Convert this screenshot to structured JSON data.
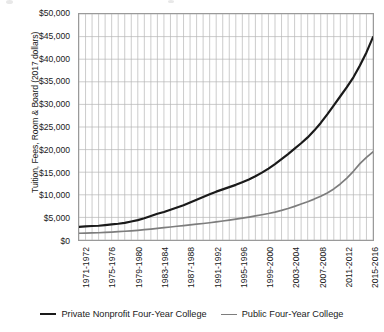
{
  "chart_data": {
    "type": "line",
    "title": "",
    "xlabel": "",
    "ylabel": "Tuition, Fees, Room & Board (2017 dollars)",
    "ylim": [
      0,
      50000
    ],
    "ytick_labels": [
      "$50,000",
      "$45,000",
      "$40,000",
      "$35,000",
      "$30,000",
      "$25,000",
      "$20,000",
      "$15,000",
      "$10,000",
      "$5,000",
      "$0"
    ],
    "ytick_values": [
      50000,
      45000,
      40000,
      35000,
      30000,
      25000,
      20000,
      15000,
      10000,
      5000,
      0
    ],
    "grid": true,
    "legend_position": "bottom",
    "x_axis_note": "Academic years 1971-1972 through 2016-2017; minor gridline every year, label every 4 years",
    "categories": [
      "1971-1972",
      "1972-1973",
      "1973-1974",
      "1974-1975",
      "1975-1976",
      "1976-1977",
      "1977-1978",
      "1978-1979",
      "1979-1980",
      "1980-1981",
      "1981-1982",
      "1982-1983",
      "1983-1984",
      "1984-1985",
      "1985-1986",
      "1986-1987",
      "1987-1988",
      "1988-1989",
      "1989-1990",
      "1990-1991",
      "1991-1992",
      "1992-1993",
      "1993-1994",
      "1994-1995",
      "1995-1996",
      "1996-1997",
      "1997-1998",
      "1998-1999",
      "1999-2000",
      "2000-2001",
      "2001-2002",
      "2002-2003",
      "2003-2004",
      "2004-2005",
      "2005-2006",
      "2006-2007",
      "2007-2008",
      "2008-2009",
      "2009-2010",
      "2010-2011",
      "2011-2012",
      "2012-2013",
      "2013-2014",
      "2014-2015",
      "2015-2016",
      "2016-2017"
    ],
    "xtick_labels": [
      "1971-1972",
      "1975-1976",
      "1979-1980",
      "1983-1984",
      "1987-1988",
      "1991-1992",
      "1995-1996",
      "1999-2000",
      "2003-2004",
      "2007-2008",
      "2011-2012",
      "2015-2016"
    ],
    "xtick_indices": [
      0,
      4,
      8,
      12,
      16,
      20,
      24,
      28,
      32,
      36,
      40,
      44
    ],
    "series": [
      {
        "name": "Private Nonprofit Four-Year College",
        "color": "#1a1a1a",
        "values": [
          2900,
          3000,
          3100,
          3150,
          3300,
          3450,
          3600,
          3800,
          4100,
          4400,
          4800,
          5300,
          5800,
          6200,
          6700,
          7200,
          7700,
          8300,
          8900,
          9500,
          10100,
          10700,
          11200,
          11700,
          12200,
          12800,
          13400,
          14100,
          14900,
          15800,
          16800,
          17900,
          19000,
          20200,
          21400,
          22700,
          24200,
          25900,
          27800,
          29800,
          31800,
          33800,
          36000,
          38600,
          41500,
          44900
        ]
      },
      {
        "name": "Public Four-Year College",
        "color": "#7d7d7d",
        "values": [
          1500,
          1530,
          1560,
          1600,
          1680,
          1760,
          1840,
          1930,
          2030,
          2150,
          2280,
          2420,
          2570,
          2720,
          2880,
          3040,
          3200,
          3350,
          3500,
          3650,
          3820,
          4000,
          4200,
          4400,
          4620,
          4850,
          5080,
          5320,
          5580,
          5860,
          6180,
          6550,
          6980,
          7450,
          7950,
          8480,
          9050,
          9680,
          10400,
          11300,
          12400,
          13700,
          15200,
          16900,
          18300,
          19500
        ]
      }
    ]
  },
  "legend": {
    "items": [
      {
        "label": "Private Nonprofit Four-Year College",
        "style": "private"
      },
      {
        "label": "Public Four-Year College",
        "style": "public"
      }
    ]
  }
}
